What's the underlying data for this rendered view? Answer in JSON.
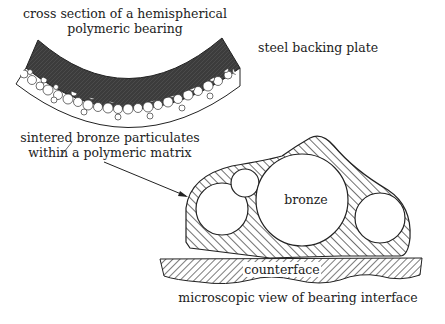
{
  "diagram": {
    "labels": {
      "title_line1": "cross section of a hemispherical",
      "title_line2": "polymeric bearing",
      "steel": "steel backing plate",
      "sintered_line1": "sintered bronze particulates",
      "sintered_line2": "within a polymeric matrix",
      "bronze": "bronze",
      "counterface": "counterface",
      "micro": "microscopic view of bearing interface"
    },
    "colors": {
      "ink": "#222222",
      "steel": "#3a3a3a",
      "background": "#ffffff"
    }
  }
}
